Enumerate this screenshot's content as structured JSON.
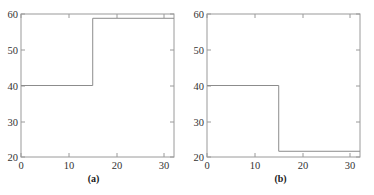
{
  "figure": {
    "background_color": "#ffffff",
    "axis_color": "#9a9a9a",
    "line_color": "#8c8c8c",
    "tick_label_color": "#333333",
    "caption_color": "#1a1a1a"
  },
  "panels": [
    {
      "id": "a",
      "caption": "(a)",
      "chart_data": {
        "type": "line",
        "title": "",
        "xlabel": "",
        "ylabel": "",
        "xlim": [
          0,
          32
        ],
        "ylim": [
          20,
          60
        ],
        "xticks": [
          0,
          10,
          20,
          30
        ],
        "xticklabels": [
          "0",
          "10",
          "20",
          "30"
        ],
        "yticks": [
          20,
          30,
          40,
          50,
          60
        ],
        "yticklabels": [
          "20",
          "30",
          "40",
          "50",
          "60"
        ],
        "grid": false,
        "legend": "none",
        "series": [
          {
            "name": "step-up",
            "drawstyle": "steps-post",
            "x": [
              0,
              15,
              15,
              32
            ],
            "y": [
              40,
              40,
              58.8,
              58.8
            ]
          }
        ],
        "annotations": [
          "step increase from 40 to about 59 at x = 15"
        ]
      }
    },
    {
      "id": "b",
      "caption": "(b)",
      "chart_data": {
        "type": "line",
        "title": "",
        "xlabel": "",
        "ylabel": "",
        "xlim": [
          0,
          32
        ],
        "ylim": [
          20,
          60
        ],
        "xticks": [
          0,
          10,
          20,
          30
        ],
        "xticklabels": [
          "0",
          "10",
          "20",
          "30"
        ],
        "yticks": [
          20,
          30,
          40,
          50,
          60
        ],
        "yticklabels": [
          "20",
          "30",
          "40",
          "50",
          "60"
        ],
        "grid": false,
        "legend": "none",
        "series": [
          {
            "name": "step-down",
            "drawstyle": "steps-post",
            "x": [
              0,
              15,
              15,
              32
            ],
            "y": [
              40,
              40,
              21.6,
              21.6
            ]
          }
        ],
        "annotations": [
          "step decrease from 40 to about 21.6 at x = 15"
        ]
      }
    }
  ]
}
